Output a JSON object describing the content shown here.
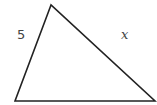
{
  "diagram": {
    "type": "triangle",
    "vertices": {
      "top": [
        51,
        5
      ],
      "bottom_left": [
        15,
        101
      ],
      "bottom_right": [
        155,
        101
      ]
    },
    "labels": {
      "left_side": "5",
      "right_side": "x"
    },
    "stroke_color": "#222222"
  }
}
